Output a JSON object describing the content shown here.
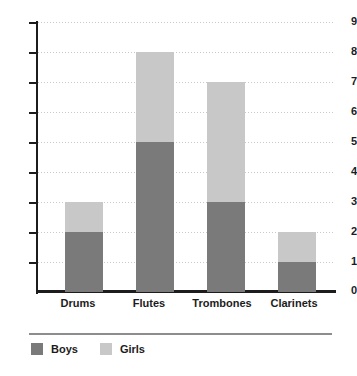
{
  "chart_data": {
    "type": "bar",
    "subtype": "stacked-bar",
    "title": "",
    "xlabel": "",
    "ylabel": "",
    "categories": [
      "Drums",
      "Flutes",
      "Trombones",
      "Clarinets"
    ],
    "series": [
      {
        "name": "Boys",
        "color": "#7a7a7a",
        "values": [
          2,
          5,
          3,
          1
        ]
      },
      {
        "name": "Girls",
        "color": "#c8c8c8",
        "values": [
          1,
          3,
          4,
          1
        ]
      }
    ],
    "totals": [
      3,
      8,
      7,
      2
    ],
    "ylim": [
      0,
      9
    ],
    "ytick_labels": [
      "0",
      "1",
      "2",
      "3",
      "4",
      "5",
      "6",
      "7",
      "8",
      "9"
    ],
    "ytick_values": [
      0,
      1,
      2,
      3,
      4,
      5,
      6,
      7,
      8,
      9
    ],
    "grid": true,
    "grid_style": "dotted-horizontal",
    "grid_color": "#c9c9c9",
    "legend_position": "bottom-left",
    "axis_color": "#1c1c1c",
    "background": "#ffffff"
  },
  "legend": {
    "entries": [
      {
        "label": "Boys",
        "swatch": "boys-swatch"
      },
      {
        "label": "Girls",
        "swatch": "girls-swatch"
      }
    ]
  }
}
